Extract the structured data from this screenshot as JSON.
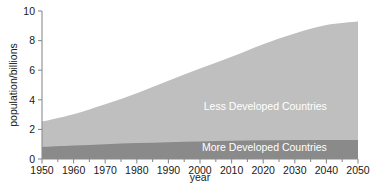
{
  "chart_data": {
    "type": "area",
    "title": "",
    "xlabel": "year",
    "ylabel": "population/billions",
    "xlim": [
      1950,
      2050
    ],
    "ylim": [
      0,
      10
    ],
    "grid": false,
    "legend_position": "inline-right",
    "stacked": true,
    "x": [
      1950,
      1960,
      1970,
      1980,
      1990,
      2000,
      2010,
      2020,
      2030,
      2040,
      2050
    ],
    "xticks": [
      "1950",
      "1960",
      "1970",
      "1980",
      "1990",
      "2000",
      "2010",
      "2020",
      "2030",
      "2040",
      "2050"
    ],
    "yticks": [
      "0",
      "2",
      "4",
      "6",
      "8",
      "10"
    ],
    "series": [
      {
        "name": "More Developed Countries",
        "color": "#8a8a8a",
        "values": [
          0.81,
          0.91,
          1.0,
          1.08,
          1.14,
          1.19,
          1.23,
          1.26,
          1.28,
          1.29,
          1.29
        ]
      },
      {
        "name": "Less Developed Countries",
        "color": "#bfbfbf",
        "values": [
          1.72,
          2.12,
          2.7,
          3.37,
          4.15,
          4.92,
          5.68,
          6.5,
          7.2,
          7.76,
          8.0
        ]
      }
    ],
    "totals": [
      2.53,
      3.03,
      3.7,
      4.45,
      5.29,
      6.11,
      6.91,
      7.76,
      8.48,
      9.05,
      9.29
    ],
    "annotations": [
      {
        "text": "Less Developed Countries",
        "x": 2018,
        "y": 3.3
      },
      {
        "text": "More Developed Countries",
        "x": 2018,
        "y": 0.55
      }
    ]
  },
  "axes": {
    "y_title": "population/billions",
    "x_title": "year"
  },
  "colors": {
    "less_developed": "#bfbfbf",
    "more_developed": "#8a8a8a",
    "axis": "#8c8c8c",
    "text": "#1a1a1a",
    "label_text": "#ffffff",
    "background": "#ffffff"
  }
}
